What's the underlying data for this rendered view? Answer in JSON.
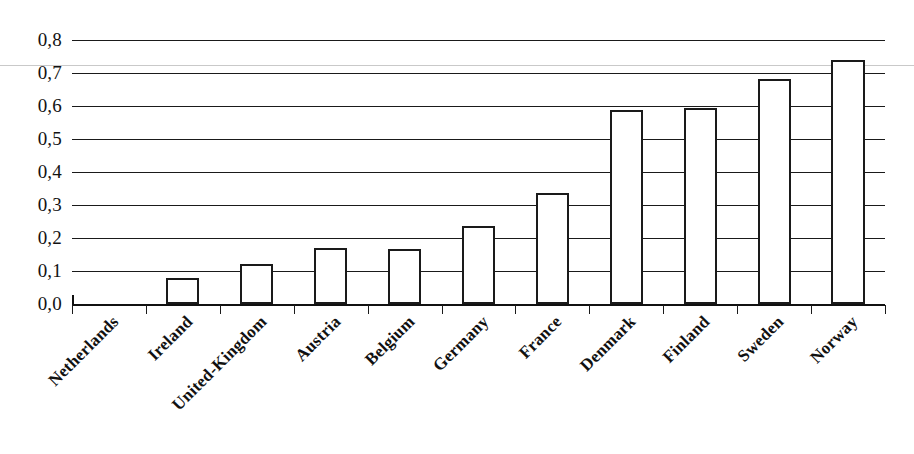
{
  "chart_data": {
    "type": "bar",
    "title": "",
    "subtitle": "",
    "xlabel": "",
    "ylabel": "",
    "categories": [
      "Netherlands",
      "Ireland",
      "United-Kingdom",
      "Austria",
      "Belgium",
      "Germany",
      "France",
      "Denmark",
      "Finland",
      "Sweden",
      "Norway"
    ],
    "values": [
      0.0,
      0.078,
      0.122,
      0.169,
      0.168,
      0.235,
      0.335,
      0.589,
      0.595,
      0.681,
      0.74
    ],
    "ylim": [
      0.0,
      0.8
    ],
    "ytick_values": [
      0.8,
      0.7,
      0.6,
      0.5,
      0.4,
      0.3,
      0.2,
      0.1,
      0.0
    ],
    "ytick_labels": [
      "0,8",
      "0,7",
      "0,6",
      "0,5",
      "0,4",
      "0,3",
      "0,2",
      "0,1",
      "0,0"
    ],
    "grid": true,
    "grid_orientation": "horizontal",
    "legend": null,
    "legend_position": "none",
    "bar_fill_color": "#ffffff",
    "bar_edge_color": "#1a1a1a",
    "grid_color": "#1a1a1a",
    "axis_color": "#111111",
    "decimal_separator": ",",
    "label_rotation_degrees": -45
  }
}
